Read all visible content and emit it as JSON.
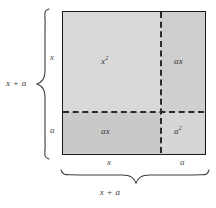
{
  "figure": {
    "square": {
      "quadrants": [
        {
          "id": "top-left",
          "label_base": "x",
          "label_exponent": "2",
          "shade": "#d9d9d9"
        },
        {
          "id": "top-right",
          "label_base": "ax",
          "label_exponent": "",
          "shade": "#cfcfcf"
        },
        {
          "id": "bottom-left",
          "label_base": "ax",
          "label_exponent": "",
          "shade": "#c9c9c9"
        },
        {
          "id": "bottom-right",
          "label_base": "a",
          "label_exponent": "2",
          "shade": "#d6d6d6"
        }
      ]
    },
    "edges": {
      "left_upper": "x",
      "left_lower": "a",
      "bottom_left": "x",
      "bottom_right": "a"
    },
    "dimensions": {
      "height_total": "x + a",
      "width_total": "x + a"
    },
    "colors": {
      "outline": "#1b1b1b",
      "dashed_line": "#2a2a2a",
      "brace": "#3c3c3c",
      "text": "#3a3a3a",
      "background": "#ffffff"
    }
  }
}
